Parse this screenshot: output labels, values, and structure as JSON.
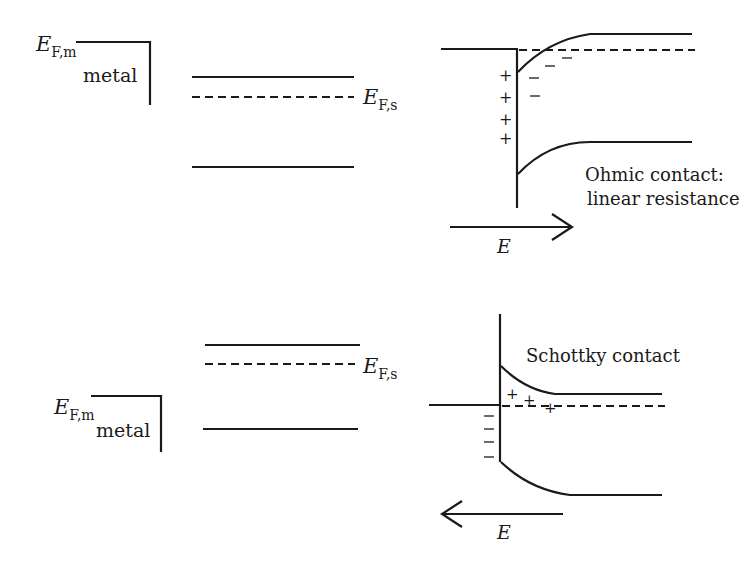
{
  "diagram": {
    "type": "band-diagram",
    "panels": [
      {
        "id": "ohmic",
        "before": {
          "metal_fermi_label": {
            "main": "E",
            "sub": "F,m"
          },
          "metal_label": "metal",
          "semiconductor_fermi_label": {
            "main": "E",
            "sub": "F,s"
          }
        },
        "after": {
          "caption_line1": "Ohmic contact:",
          "caption_line2": "linear resistance",
          "field_label": "E",
          "field_direction": "right",
          "metal_charges": [
            "+",
            "+",
            "+",
            "+"
          ],
          "semiconductor_charges": [
            "−",
            "−",
            "−",
            "−"
          ]
        }
      },
      {
        "id": "schottky",
        "before": {
          "metal_fermi_label": {
            "main": "E",
            "sub": "F,m"
          },
          "metal_label": "metal",
          "semiconductor_fermi_label": {
            "main": "E",
            "sub": "F,s"
          }
        },
        "after": {
          "caption": "Schottky contact",
          "field_label": "E",
          "field_direction": "left",
          "metal_charges": [
            "−",
            "−",
            "−",
            "−"
          ],
          "semiconductor_charges": [
            "+",
            "+",
            "+"
          ]
        }
      }
    ]
  }
}
